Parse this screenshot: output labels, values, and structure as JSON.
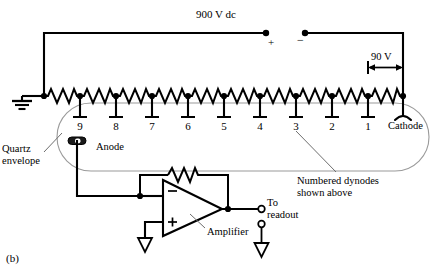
{
  "figure": {
    "caption": "(b)"
  },
  "supply": {
    "label": "900 V dc",
    "plus_terminal": "+",
    "minus_terminal": "−"
  },
  "divider": {
    "step_voltage_label": "90 V",
    "dynode_labels": [
      "9",
      "8",
      "7",
      "6",
      "5",
      "4",
      "3",
      "2",
      "1"
    ],
    "cathode_label": "Cathode"
  },
  "tube": {
    "envelope_label_line1": "Quartz",
    "envelope_label_line2": "envelope",
    "anode_label": "Anode",
    "dynode_note_line1": "Numbered dynodes",
    "dynode_note_line2": "shown above"
  },
  "amplifier": {
    "label": "Amplifier",
    "inverting_input": "−",
    "noninverting_input": "+"
  },
  "output": {
    "label_line1": "To",
    "label_line2": "readout"
  },
  "colors": {
    "wire": "#000000",
    "envelope": "#9a9a9a",
    "leader": "#6e6e6e",
    "background": "#ffffff",
    "text": "#000000"
  }
}
